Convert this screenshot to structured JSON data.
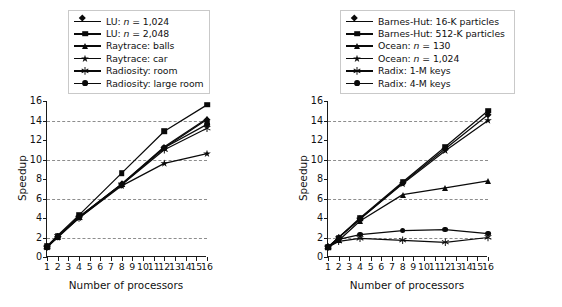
{
  "figure": {
    "background": "#ffffff",
    "ink": "#0a0a0a",
    "grid_color": "#8d8d8d"
  },
  "panels": [
    {
      "id": "left",
      "legend_position": "top-center",
      "chart_data": {
        "type": "line",
        "title": "",
        "xlabel": "Number of processors",
        "ylabel": "Speedup",
        "x": [
          1,
          2,
          4,
          8,
          12,
          16
        ],
        "xlim": [
          1,
          16
        ],
        "ylim": [
          0,
          16
        ],
        "xticks": [
          1,
          2,
          3,
          4,
          5,
          6,
          7,
          8,
          9,
          10,
          11,
          12,
          13,
          14,
          15,
          16
        ],
        "yticks": [
          0,
          2,
          4,
          6,
          8,
          10,
          12,
          14,
          16
        ],
        "gridlines_y": [
          2,
          6,
          10,
          14
        ],
        "grid": "dashed-horizontal",
        "legend_position": "above-axes",
        "series": [
          {
            "name": "LU: n = 1,024",
            "label_prefix": "LU: ",
            "label_italic": "n",
            "label_suffix": " = 1,024",
            "marker": "diamond",
            "values": [
              1.0,
              2.1,
              4.1,
              7.5,
              11.2,
              14.1
            ]
          },
          {
            "name": "LU: n = 2,048",
            "label_prefix": "LU: ",
            "label_italic": "n",
            "label_suffix": " = 2,048",
            "marker": "square",
            "values": [
              1.1,
              2.2,
              4.3,
              8.6,
              12.9,
              15.6
            ]
          },
          {
            "name": "Raytrace: balls",
            "label_prefix": "Raytrace: balls",
            "label_italic": "",
            "label_suffix": "",
            "marker": "triangle",
            "values": [
              1.0,
              2.1,
              4.1,
              7.5,
              11.3,
              14.2
            ]
          },
          {
            "name": "Raytrace: car",
            "label_prefix": "Raytrace: car",
            "label_italic": "",
            "label_suffix": "",
            "marker": "star",
            "values": [
              1.0,
              2.0,
              4.0,
              7.3,
              9.6,
              10.6
            ]
          },
          {
            "name": "Radiosity: room",
            "label_prefix": "Radiosity: room",
            "label_italic": "",
            "label_suffix": "",
            "marker": "asterisk",
            "values": [
              1.0,
              2.1,
              4.0,
              7.4,
              11.0,
              13.2
            ]
          },
          {
            "name": "Radiosity: large room",
            "label_prefix": "Radiosity: large room",
            "label_italic": "",
            "label_suffix": "",
            "marker": "circle",
            "values": [
              1.0,
              2.1,
              4.1,
              7.4,
              11.2,
              13.6
            ]
          }
        ]
      }
    },
    {
      "id": "right",
      "legend_position": "top-center",
      "chart_data": {
        "type": "line",
        "title": "",
        "xlabel": "Number of processors",
        "ylabel": "Speedup",
        "x": [
          1,
          2,
          4,
          8,
          12,
          16
        ],
        "xlim": [
          1,
          16
        ],
        "ylim": [
          0,
          16
        ],
        "xticks": [
          1,
          2,
          3,
          4,
          5,
          6,
          7,
          8,
          9,
          10,
          11,
          12,
          13,
          14,
          15,
          16
        ],
        "yticks": [
          0,
          2,
          4,
          6,
          8,
          10,
          12,
          14,
          16
        ],
        "gridlines_y": [
          2,
          6,
          10,
          14
        ],
        "grid": "dashed-horizontal",
        "legend_position": "above-axes",
        "series": [
          {
            "name": "Barnes-Hut: 16-K particles",
            "label_prefix": "Barnes-Hut: 16-K particles",
            "label_italic": "",
            "label_suffix": "",
            "marker": "diamond",
            "values": [
              1.0,
              2.0,
              3.9,
              7.6,
              11.1,
              14.6
            ]
          },
          {
            "name": "Barnes-Hut: 512-K particles",
            "label_prefix": "Barnes-Hut: 512-K particles",
            "label_italic": "",
            "label_suffix": "",
            "marker": "square",
            "values": [
              1.0,
              2.0,
              4.0,
              7.7,
              11.3,
              15.0
            ]
          },
          {
            "name": "Ocean: n = 130",
            "label_prefix": "Ocean: ",
            "label_italic": "n",
            "label_suffix": " = 130",
            "marker": "triangle",
            "values": [
              1.0,
              1.7,
              3.7,
              6.4,
              7.1,
              7.8
            ]
          },
          {
            "name": "Ocean: n = 1,024",
            "label_prefix": "Ocean: ",
            "label_italic": "n",
            "label_suffix": " = 1,024",
            "marker": "star",
            "values": [
              1.0,
              2.0,
              3.9,
              7.5,
              10.9,
              14.0
            ]
          },
          {
            "name": "Radix: 1-M keys",
            "label_prefix": "Radix: 1-M keys",
            "label_italic": "",
            "label_suffix": "",
            "marker": "asterisk",
            "values": [
              1.0,
              1.6,
              1.9,
              1.7,
              1.5,
              2.0
            ]
          },
          {
            "name": "Radix: 4-M keys",
            "label_prefix": "Radix: 4-M keys",
            "label_italic": "",
            "label_suffix": "",
            "marker": "circle",
            "values": [
              1.0,
              1.8,
              2.3,
              2.7,
              2.8,
              2.4
            ]
          }
        ]
      }
    }
  ]
}
